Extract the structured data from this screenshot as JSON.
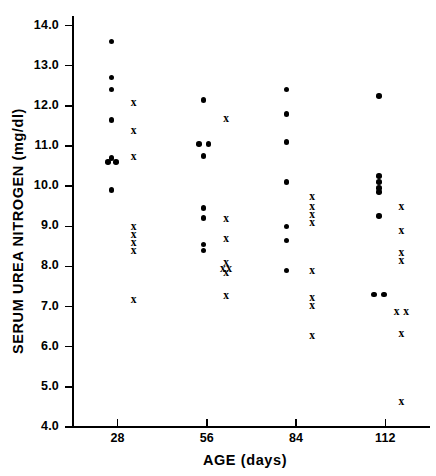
{
  "chart_data": {
    "type": "scatter",
    "title": "",
    "xlabel": "AGE (days)",
    "ylabel": "SERUM UREA NITROGEN (mg/dl)",
    "xlim": [
      14,
      126
    ],
    "ylim": [
      4.0,
      14.0
    ],
    "grid": false,
    "legend": "none",
    "xticks": [
      28,
      56,
      84,
      112
    ],
    "xticklabels": [
      "28",
      "56",
      "84",
      "112"
    ],
    "yticks": [
      4.0,
      5.0,
      6.0,
      7.0,
      8.0,
      9.0,
      10.0,
      11.0,
      12.0,
      13.0,
      14.0
    ],
    "yticklabels": [
      "4.0",
      "5.0",
      "6.0",
      "7.0",
      "8.0",
      "9.0",
      "10.0",
      "11.0",
      "12.0",
      "13.0",
      "14.0"
    ],
    "series": [
      {
        "name": "dot-group",
        "marker": "filled-circle",
        "color": "#000000",
        "points": [
          {
            "x": 26,
            "y": 13.6
          },
          {
            "x": 26,
            "y": 12.7
          },
          {
            "x": 26,
            "y": 12.4
          },
          {
            "x": 26,
            "y": 11.65
          },
          {
            "x": 26,
            "y": 10.7
          },
          {
            "x": 25,
            "y": 10.6
          },
          {
            "x": 27.5,
            "y": 10.6
          },
          {
            "x": 26,
            "y": 9.9
          },
          {
            "x": 55,
            "y": 12.15
          },
          {
            "x": 53.5,
            "y": 11.05
          },
          {
            "x": 56.5,
            "y": 11.05
          },
          {
            "x": 55,
            "y": 10.75
          },
          {
            "x": 55,
            "y": 9.45
          },
          {
            "x": 55,
            "y": 9.2
          },
          {
            "x": 55,
            "y": 8.55
          },
          {
            "x": 55,
            "y": 8.4
          },
          {
            "x": 81,
            "y": 12.4
          },
          {
            "x": 81,
            "y": 11.8
          },
          {
            "x": 81,
            "y": 11.1
          },
          {
            "x": 81,
            "y": 10.1
          },
          {
            "x": 81,
            "y": 9.0
          },
          {
            "x": 81,
            "y": 8.65
          },
          {
            "x": 81,
            "y": 7.9
          },
          {
            "x": 110,
            "y": 12.25
          },
          {
            "x": 110,
            "y": 10.25
          },
          {
            "x": 110,
            "y": 10.1
          },
          {
            "x": 110,
            "y": 9.95
          },
          {
            "x": 110,
            "y": 9.85
          },
          {
            "x": 110,
            "y": 9.25
          },
          {
            "x": 108.5,
            "y": 7.3
          },
          {
            "x": 111.5,
            "y": 7.3
          }
        ]
      },
      {
        "name": "x-group",
        "marker": "x-cross",
        "color": "#000000",
        "points": [
          {
            "x": 33,
            "y": 12.1
          },
          {
            "x": 33,
            "y": 11.4
          },
          {
            "x": 33,
            "y": 10.75
          },
          {
            "x": 33,
            "y": 9.0
          },
          {
            "x": 33,
            "y": 8.8
          },
          {
            "x": 33,
            "y": 8.6
          },
          {
            "x": 33,
            "y": 8.4
          },
          {
            "x": 33,
            "y": 7.2
          },
          {
            "x": 62,
            "y": 11.7
          },
          {
            "x": 62,
            "y": 9.2
          },
          {
            "x": 62,
            "y": 8.7
          },
          {
            "x": 62,
            "y": 8.1
          },
          {
            "x": 61,
            "y": 7.95
          },
          {
            "x": 63,
            "y": 7.95
          },
          {
            "x": 62,
            "y": 7.85
          },
          {
            "x": 62,
            "y": 7.3
          },
          {
            "x": 89,
            "y": 9.75
          },
          {
            "x": 89,
            "y": 9.5
          },
          {
            "x": 89,
            "y": 9.3
          },
          {
            "x": 89,
            "y": 9.1
          },
          {
            "x": 89,
            "y": 7.9
          },
          {
            "x": 89,
            "y": 7.25
          },
          {
            "x": 89,
            "y": 7.05
          },
          {
            "x": 89,
            "y": 6.3
          },
          {
            "x": 117,
            "y": 9.5
          },
          {
            "x": 117,
            "y": 8.9
          },
          {
            "x": 117,
            "y": 8.35
          },
          {
            "x": 117,
            "y": 8.15
          },
          {
            "x": 115.5,
            "y": 6.9
          },
          {
            "x": 118.5,
            "y": 6.9
          },
          {
            "x": 117,
            "y": 6.35
          },
          {
            "x": 117,
            "y": 4.65
          }
        ]
      }
    ]
  }
}
